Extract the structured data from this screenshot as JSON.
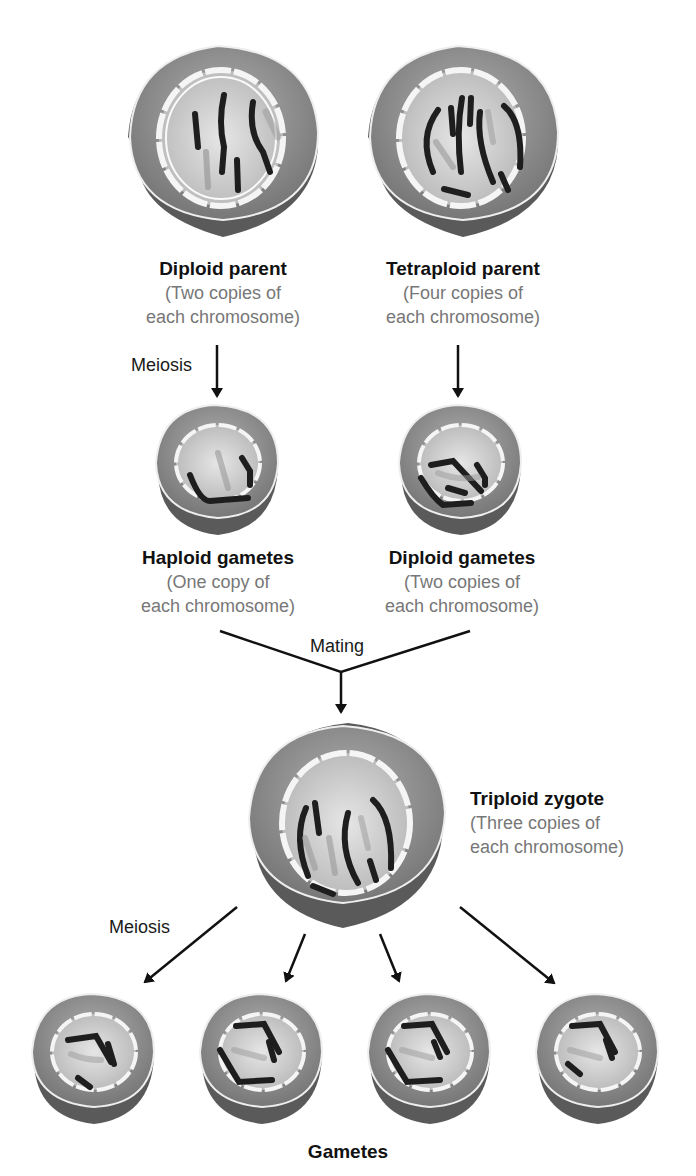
{
  "colors": {
    "cell_outer": "#8f8f8f",
    "cell_rim": "#6a6a6a",
    "nucleus": "#c9c9c9",
    "envelope": "#f2f2f2",
    "chromosome_dark": "#1e1e1e",
    "chromosome_light": "#9a9a9a",
    "text_title": "#111111",
    "text_sub": "#777777",
    "arrow": "#111111"
  },
  "parents": {
    "diploid": {
      "title": "Diploid parent",
      "line1": "(Two copies of",
      "line2": "each chromosome)"
    },
    "tetraploid": {
      "title": "Tetraploid parent",
      "line1": "(Four copies of",
      "line2": "each chromosome)"
    }
  },
  "gametes_first": {
    "haploid": {
      "title": "Haploid gametes",
      "line1": "(One copy of",
      "line2": "each chromosome)"
    },
    "diploid": {
      "title": "Diploid gametes",
      "line1": "(Two copies of",
      "line2": "each chromosome)"
    }
  },
  "zygote": {
    "title": "Triploid zygote",
    "line1": "(Three copies of",
    "line2": "each chromosome)"
  },
  "process_labels": {
    "meiosis_top": "Meiosis",
    "mating": "Mating",
    "meiosis_bottom": "Meiosis"
  },
  "final": {
    "title": "Gametes",
    "count": 4
  }
}
